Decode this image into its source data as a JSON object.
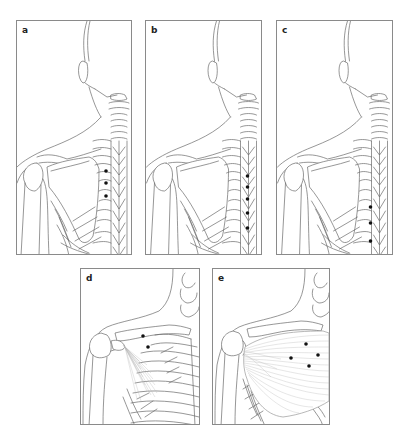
{
  "figure": {
    "panels": [
      {
        "id": "a",
        "label": "a",
        "view": "posterior upper back, shoulder and neck",
        "points_count": 3
      },
      {
        "id": "b",
        "label": "b",
        "view": "posterior upper back, shoulder and neck",
        "points_count": 5
      },
      {
        "id": "c",
        "label": "c",
        "view": "posterior upper back, shoulder and neck",
        "points_count": 3
      },
      {
        "id": "d",
        "label": "d",
        "view": "anterior chest with pectoralis minor",
        "points_count": 2
      },
      {
        "id": "e",
        "label": "e",
        "view": "anterior chest with pectoralis major",
        "points_count": 4
      }
    ]
  }
}
